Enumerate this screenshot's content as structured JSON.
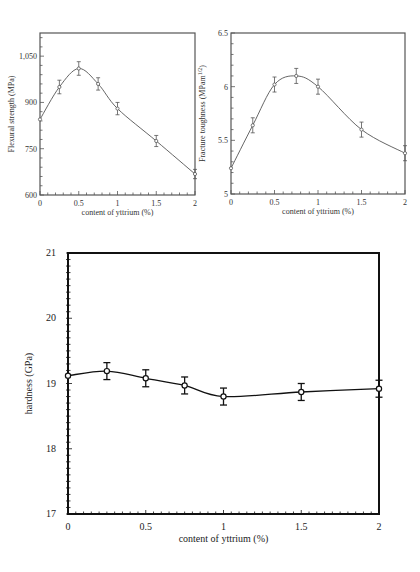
{
  "chart_data": [
    {
      "id": "flexural",
      "type": "line",
      "title": "",
      "xlabel": "content of yttrium (%)",
      "ylabel": "Flexural strength (MPa)",
      "xlim": [
        0,
        2
      ],
      "ylim": [
        600,
        1125
      ],
      "xticks": [
        0,
        0.5,
        1,
        1.5,
        2
      ],
      "xtick_labels": [
        "0",
        "0.5",
        "1",
        "1.5",
        "2"
      ],
      "yticks": [
        600,
        750,
        900,
        1050
      ],
      "ytick_labels": [
        "600",
        "750",
        "900",
        "1,050"
      ],
      "grid": false,
      "smooth": true,
      "marker": "open-circle",
      "series": [
        {
          "name": "Flexural strength",
          "x": [
            0,
            0.25,
            0.5,
            0.75,
            1,
            1.5,
            2
          ],
          "y": [
            845,
            950,
            1010,
            960,
            880,
            775,
            668
          ],
          "error": [
            0,
            22,
            22,
            20,
            20,
            18,
            15
          ]
        }
      ]
    },
    {
      "id": "toughness",
      "type": "line",
      "title": "",
      "xlabel": "content of yttrium (%)",
      "ylabel": "Fracture toughness (MPam^1/2)",
      "xlim": [
        0,
        2
      ],
      "ylim": [
        5,
        6.5
      ],
      "xticks": [
        0,
        0.5,
        1,
        1.5,
        2
      ],
      "xtick_labels": [
        "0",
        "0.5",
        "1",
        "1.5",
        "2"
      ],
      "yticks": [
        5,
        5.5,
        6,
        6.5
      ],
      "ytick_labels": [
        "5",
        "5.5",
        "6",
        "6.5"
      ],
      "grid": false,
      "smooth": true,
      "marker": "open-circle",
      "series": [
        {
          "name": "Fracture toughness",
          "x": [
            0,
            0.25,
            0.5,
            0.75,
            1,
            1.5,
            2
          ],
          "y": [
            5.24,
            5.64,
            6.02,
            6.1,
            6.0,
            5.6,
            5.38
          ],
          "error": [
            0,
            0.07,
            0.07,
            0.07,
            0.07,
            0.07,
            0.07
          ]
        }
      ]
    },
    {
      "id": "hardness",
      "type": "line",
      "title": "",
      "xlabel": "content of yttrium (%)",
      "ylabel": "hardness (GPa)",
      "xlim": [
        0,
        2
      ],
      "ylim": [
        17,
        21
      ],
      "xticks": [
        0,
        0.5,
        1,
        1.5,
        2
      ],
      "xtick_labels": [
        "0",
        "0.5",
        "1",
        "1.5",
        "2"
      ],
      "yticks": [
        17,
        18,
        19,
        20,
        21
      ],
      "ytick_labels": [
        "17",
        "18",
        "19",
        "20",
        "21"
      ],
      "grid": false,
      "smooth": true,
      "marker": "open-circle",
      "series": [
        {
          "name": "Hardness",
          "x": [
            0,
            0.25,
            0.5,
            0.75,
            1,
            1.5,
            2
          ],
          "y": [
            19.12,
            19.19,
            19.08,
            18.97,
            18.8,
            18.87,
            18.92
          ],
          "error": [
            0,
            0.13,
            0.13,
            0.13,
            0.13,
            0.13,
            0.13
          ]
        }
      ]
    }
  ]
}
